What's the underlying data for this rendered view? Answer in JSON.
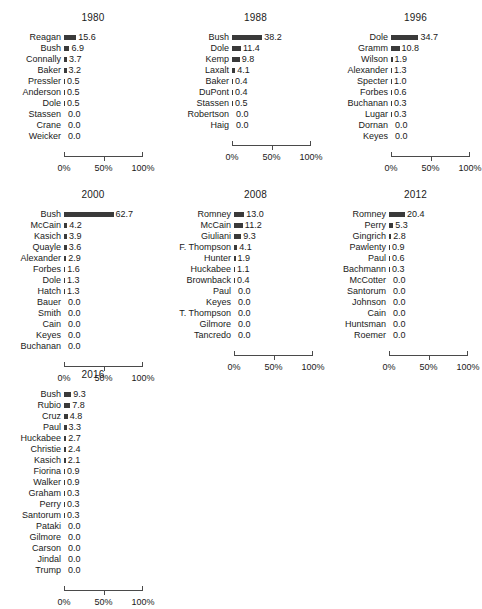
{
  "figure": {
    "axis_ticks": [
      "0%",
      "50%",
      "100%"
    ],
    "axis_tick_values": [
      0,
      50,
      100
    ],
    "bar_color": "#3a3a3a",
    "background_color": "#ffffff"
  },
  "chart_data": {
    "type": "bar",
    "title": "",
    "xlabel": "",
    "ylabel": "",
    "xlim": [
      0,
      100
    ],
    "grid": false,
    "legend": false,
    "orientation": "horizontal",
    "layout": "small-multiples 3x3",
    "panels": [
      {
        "title": "1980",
        "categories": [
          "Reagan",
          "Bush",
          "Connally",
          "Baker",
          "Pressler",
          "Anderson",
          "Dole",
          "Stassen",
          "Crane",
          "Weicker"
        ],
        "values": [
          15.6,
          6.9,
          3.7,
          3.2,
          0.5,
          0.5,
          0.5,
          0.0,
          0.0,
          0.0
        ],
        "value_labels": [
          "15.6",
          "6.9",
          "3.7",
          "3.2",
          "0.5",
          "0.5",
          "0.5",
          "0.0",
          "0.0",
          "0.0"
        ]
      },
      {
        "title": "1988",
        "categories": [
          "Bush",
          "Dole",
          "Kemp",
          "Laxalt",
          "Baker",
          "DuPont",
          "Stassen",
          "Robertson",
          "Haig"
        ],
        "values": [
          38.2,
          11.4,
          9.8,
          4.1,
          0.4,
          0.4,
          0.5,
          0.0,
          0.0
        ],
        "value_labels": [
          "38.2",
          "11.4",
          "9.8",
          "4.1",
          "0.4",
          "0.4",
          "0.5",
          "0.0",
          "0.0"
        ]
      },
      {
        "title": "1996",
        "categories": [
          "Dole",
          "Gramm",
          "Wilson",
          "Alexander",
          "Specter",
          "Forbes",
          "Buchanan",
          "Lugar",
          "Dornan",
          "Keyes"
        ],
        "values": [
          34.7,
          10.8,
          1.9,
          1.3,
          1.0,
          0.6,
          0.3,
          0.3,
          0.0,
          0.0
        ],
        "value_labels": [
          "34.7",
          "10.8",
          "1.9",
          "1.3",
          "1.0",
          "0.6",
          "0.3",
          "0.3",
          "0.0",
          "0.0"
        ]
      },
      {
        "title": "2000",
        "categories": [
          "Bush",
          "McCain",
          "Kasich",
          "Quayle",
          "Alexander",
          "Forbes",
          "Dole",
          "Hatch",
          "Bauer",
          "Smith",
          "Cain",
          "Keyes",
          "Buchanan"
        ],
        "values": [
          62.7,
          4.2,
          3.9,
          3.6,
          2.9,
          1.6,
          1.3,
          1.3,
          0.0,
          0.0,
          0.0,
          0.0,
          0.0
        ],
        "value_labels": [
          "62.7",
          "4.2",
          "3.9",
          "3.6",
          "2.9",
          "1.6",
          "1.3",
          "1.3",
          "0.0",
          "0.0",
          "0.0",
          "0.0",
          "0.0"
        ]
      },
      {
        "title": "2008",
        "categories": [
          "Romney",
          "McCain",
          "Giuliani",
          "F. Thompson",
          "Hunter",
          "Huckabee",
          "Brownback",
          "Paul",
          "Keyes",
          "T. Thompson",
          "Gilmore",
          "Tancredo"
        ],
        "values": [
          13.0,
          11.2,
          9.3,
          4.1,
          1.9,
          1.1,
          0.4,
          0.0,
          0.0,
          0.0,
          0.0,
          0.0
        ],
        "value_labels": [
          "13.0",
          "11.2",
          "9.3",
          "4.1",
          "1.9",
          "1.1",
          "0.4",
          "0.0",
          "0.0",
          "0.0",
          "0.0",
          "0.0"
        ]
      },
      {
        "title": "2012",
        "categories": [
          "Romney",
          "Perry",
          "Gingrich",
          "Pawlenty",
          "Paul",
          "Bachmann",
          "McCotter",
          "Santorum",
          "Johnson",
          "Cain",
          "Huntsman",
          "Roemer"
        ],
        "values": [
          20.4,
          5.3,
          2.8,
          0.9,
          0.6,
          0.3,
          0.0,
          0.0,
          0.0,
          0.0,
          0.0,
          0.0
        ],
        "value_labels": [
          "20.4",
          "5.3",
          "2.8",
          "0.9",
          "0.6",
          "0.3",
          "0.0",
          "0.0",
          "0.0",
          "0.0",
          "0.0",
          "0.0"
        ]
      },
      {
        "title": "2016",
        "categories": [
          "Bush",
          "Rubio",
          "Cruz",
          "Paul",
          "Huckabee",
          "Christie",
          "Kasich",
          "Fiorina",
          "Walker",
          "Graham",
          "Perry",
          "Santorum",
          "Pataki",
          "Gilmore",
          "Carson",
          "Jindal",
          "Trump"
        ],
        "values": [
          9.3,
          7.8,
          4.8,
          3.3,
          2.7,
          2.4,
          2.1,
          0.9,
          0.9,
          0.3,
          0.3,
          0.3,
          0.0,
          0.0,
          0.0,
          0.0,
          0.0
        ],
        "value_labels": [
          "9.3",
          "7.8",
          "4.8",
          "3.3",
          "2.7",
          "2.4",
          "2.1",
          "0.9",
          "0.9",
          "0.3",
          "0.3",
          "0.3",
          "0.0",
          "0.0",
          "0.0",
          "0.0",
          "0.0"
        ]
      }
    ]
  }
}
